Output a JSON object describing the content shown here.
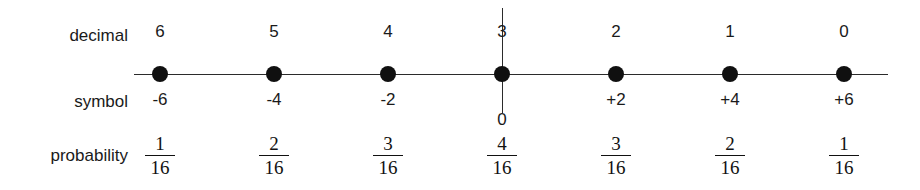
{
  "rows": {
    "decimal_label": "decimal",
    "symbol_label": "symbol",
    "probability_label": "probability"
  },
  "chart_data": {
    "type": "table",
    "title": "",
    "xlabel": "",
    "ylabel": "",
    "row_names": [
      "decimal",
      "symbol",
      "probability"
    ],
    "categories": [
      "6",
      "5",
      "4",
      "3",
      "2",
      "1",
      "0"
    ],
    "series": [
      {
        "name": "decimal",
        "values": [
          "6",
          "5",
          "4",
          "3",
          "2",
          "1",
          "0"
        ]
      },
      {
        "name": "symbol",
        "values": [
          "-6",
          "-4",
          "-2",
          "0",
          "+2",
          "+4",
          "+6"
        ]
      },
      {
        "name": "probability",
        "values": [
          "1/16",
          "2/16",
          "3/16",
          "4/16",
          "3/16",
          "2/16",
          "1/16"
        ]
      }
    ],
    "probability_numerators": [
      1,
      2,
      3,
      4,
      3,
      2,
      1
    ],
    "probability_denominators": [
      16,
      16,
      16,
      16,
      16,
      16,
      16
    ],
    "probability_decimals": [
      0.0625,
      0.125,
      0.1875,
      0.25,
      0.1875,
      0.125,
      0.0625
    ],
    "axis": {
      "origin_index": 3,
      "origin_symbol": "0",
      "has_vertical_axis_at_origin": true,
      "grid": false,
      "legend": "none"
    }
  },
  "points": [
    {
      "decimal": "6",
      "symbol": "-6",
      "numerator": "1",
      "denominator": "16",
      "x": 160,
      "center": false
    },
    {
      "decimal": "5",
      "symbol": "-4",
      "numerator": "2",
      "denominator": "16",
      "x": 274,
      "center": false
    },
    {
      "decimal": "4",
      "symbol": "-2",
      "numerator": "3",
      "denominator": "16",
      "x": 388,
      "center": false
    },
    {
      "decimal": "3",
      "symbol": "0",
      "numerator": "4",
      "denominator": "16",
      "x": 502,
      "center": true
    },
    {
      "decimal": "2",
      "symbol": "+2",
      "numerator": "3",
      "denominator": "16",
      "x": 616,
      "center": false
    },
    {
      "decimal": "1",
      "symbol": "+4",
      "numerator": "2",
      "denominator": "16",
      "x": 730,
      "center": false
    },
    {
      "decimal": "0",
      "symbol": "+6",
      "numerator": "1",
      "denominator": "16",
      "x": 844,
      "center": false
    }
  ],
  "colors": {
    "background": "#ffffff",
    "ink": "#111111",
    "axis": "#2b2b2b",
    "dot": "#101010"
  }
}
